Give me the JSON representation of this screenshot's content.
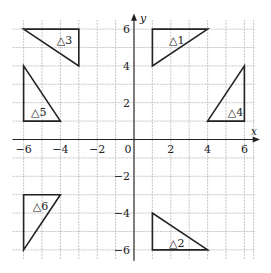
{
  "chart_data": {
    "type": "diagram",
    "title": "",
    "xlabel": "x",
    "ylabel": "y",
    "xlim": [
      -6.5,
      6.5
    ],
    "ylim": [
      -6.5,
      6.5
    ],
    "grid": true,
    "x_ticks": [
      -6,
      -4,
      -2,
      0,
      2,
      4,
      6
    ],
    "y_ticks": [
      -6,
      -4,
      -2,
      2,
      4,
      6
    ],
    "triangles": [
      {
        "name": "△1",
        "vertices": [
          [
            1,
            6
          ],
          [
            4,
            6
          ],
          [
            1,
            4
          ]
        ],
        "label_pos": [
          1.9,
          5.4
        ]
      },
      {
        "name": "△2",
        "vertices": [
          [
            1,
            -4
          ],
          [
            1,
            -6
          ],
          [
            4,
            -6
          ]
        ],
        "label_pos": [
          1.9,
          -5.6
        ]
      },
      {
        "name": "△3",
        "vertices": [
          [
            -6,
            6
          ],
          [
            -3,
            6
          ],
          [
            -3,
            4
          ]
        ],
        "label_pos": [
          -4.2,
          5.4
        ]
      },
      {
        "name": "△4",
        "vertices": [
          [
            6,
            4
          ],
          [
            6,
            1
          ],
          [
            4,
            1
          ]
        ],
        "label_pos": [
          5.1,
          1.5
        ]
      },
      {
        "name": "△5",
        "vertices": [
          [
            -6,
            4
          ],
          [
            -6,
            1
          ],
          [
            -4,
            1
          ]
        ],
        "label_pos": [
          -5.6,
          1.5
        ]
      },
      {
        "name": "△6",
        "vertices": [
          [
            -6,
            -3
          ],
          [
            -4,
            -3
          ],
          [
            -6,
            -6
          ]
        ],
        "label_pos": [
          -5.5,
          -3.6
        ]
      }
    ]
  },
  "axes": {
    "x_label": "x",
    "y_label": "y",
    "origin_label": "0"
  }
}
